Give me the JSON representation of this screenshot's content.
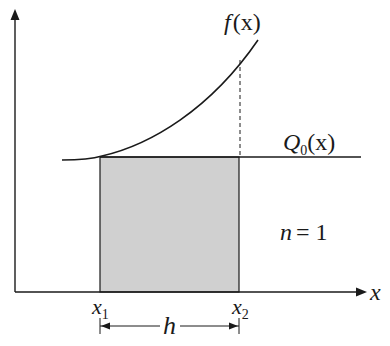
{
  "diagram": {
    "colors": {
      "line": "#1a1a1a",
      "fill": "#d0d0d0",
      "background": "#ffffff"
    },
    "labels": {
      "curve": "f",
      "curve_arg": "(x)",
      "approx_main": "Q",
      "approx_sub": "0",
      "approx_arg": "(x)",
      "n_label": "n",
      "n_eq": "= 1",
      "x_axis": "x",
      "x1_main": "x",
      "x1_sub": "1",
      "x2_main": "x",
      "x2_sub": "2",
      "h": "h"
    }
  }
}
